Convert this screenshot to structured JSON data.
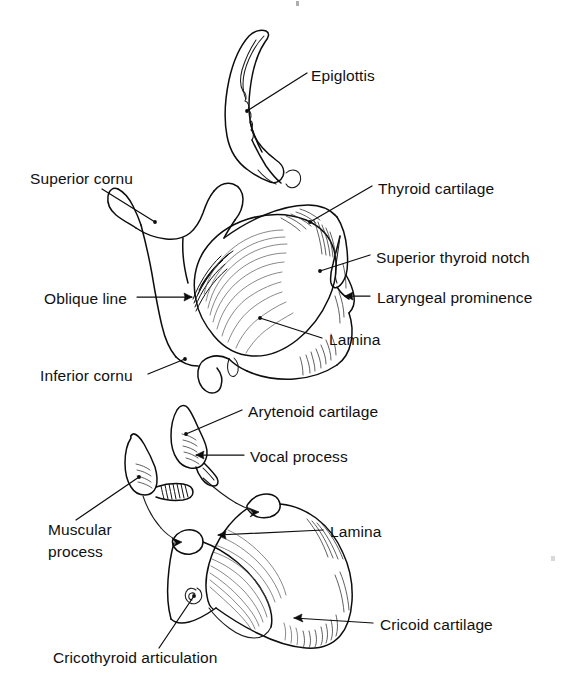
{
  "figure": {
    "background_color": "#ffffff",
    "ink_color": "#0d0d0d",
    "width": 571,
    "height": 692
  },
  "panels": [
    {
      "id": "upper-panel",
      "name": "thyroid-cartilage-and-epiglottis",
      "structures": [
        "epiglottis",
        "thyroid cartilage"
      ]
    },
    {
      "id": "lower-panel",
      "name": "cricoid-and-arytenoid-cartilages",
      "structures": [
        "arytenoid cartilage",
        "cricoid cartilage"
      ]
    }
  ],
  "labels": {
    "epiglottis": "Epiglottis",
    "superior_cornu": "Superior cornu",
    "thyroid_cartilage": "Thyroid cartilage",
    "superior_thyroid_notch": "Superior thyroid notch",
    "oblique_line": "Oblique line",
    "laryngeal_prominence": "Laryngeal prominence",
    "lamina_upper": "Lamina",
    "inferior_cornu": "Inferior cornu",
    "arytenoid_cartilage": "Arytenoid cartilage",
    "vocal_process": "Vocal process",
    "muscular_process_line1": "Muscular",
    "muscular_process_line2": "process",
    "lamina_lower": "Lamina",
    "cricoid_cartilage": "Cricoid cartilage",
    "cricothyroid_articulation": "Cricothyroid articulation"
  }
}
